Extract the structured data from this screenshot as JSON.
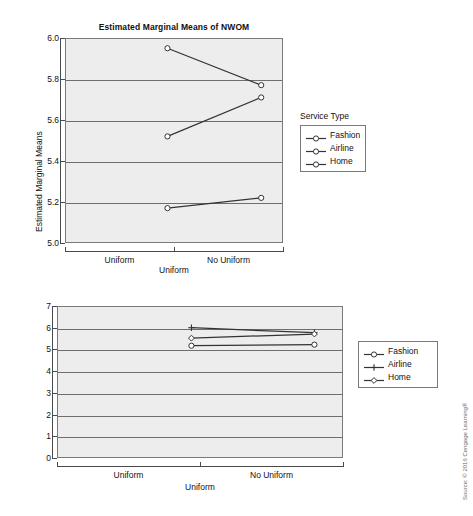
{
  "source_note": "Source: © 2016 Cengage Learning®",
  "charts": [
    {
      "id": "top",
      "title": "Estimated Marginal Means of NWOM",
      "ylabel": "Estimated Marginal Means",
      "xlabel": "Uniform",
      "categories": [
        "Uniform",
        "No Uniform"
      ],
      "yticks": [
        "6.0",
        "5.8",
        "5.6",
        "5.4",
        "5.2",
        "5.0"
      ],
      "legend_title": "Service Type",
      "legend": [
        {
          "label": "Fashion",
          "marker": "circle"
        },
        {
          "label": "Airline",
          "marker": "circle"
        },
        {
          "label": "Home",
          "marker": "circle"
        }
      ]
    },
    {
      "id": "bottom",
      "title": "",
      "ylabel": "NWOM LS Means",
      "xlabel": "Uniform",
      "categories": [
        "Uniform",
        "No Uniform"
      ],
      "yticks": [
        "7",
        "6",
        "5",
        "4",
        "3",
        "2",
        "1",
        "0"
      ],
      "legend_title": "",
      "legend": [
        {
          "label": "Fashion",
          "marker": "circle"
        },
        {
          "label": "Airline",
          "marker": "plus"
        },
        {
          "label": "Home",
          "marker": "diamond"
        }
      ]
    }
  ],
  "chart_data": [
    {
      "type": "line",
      "title": "Estimated Marginal Means of NWOM",
      "xlabel": "Uniform",
      "ylabel": "Estimated Marginal Means",
      "categories": [
        "Uniform",
        "No Uniform"
      ],
      "ylim": [
        5.0,
        6.0
      ],
      "ytick_step": 0.2,
      "grid": true,
      "legend_title": "Service Type",
      "legend_position": "right",
      "series": [
        {
          "name": "Fashion",
          "marker": "circle",
          "values": [
            5.95,
            5.77
          ]
        },
        {
          "name": "Airline",
          "marker": "circle",
          "values": [
            5.52,
            5.71
          ]
        },
        {
          "name": "Home",
          "marker": "circle",
          "values": [
            5.17,
            5.22
          ]
        }
      ]
    },
    {
      "type": "line",
      "title": "",
      "xlabel": "Uniform",
      "ylabel": "NWOM LS Means",
      "categories": [
        "Uniform",
        "No Uniform"
      ],
      "ylim": [
        0,
        7
      ],
      "ytick_step": 1,
      "grid": true,
      "legend_title": "",
      "legend_position": "right",
      "series": [
        {
          "name": "Fashion",
          "marker": "circle",
          "values": [
            5.17,
            5.22
          ]
        },
        {
          "name": "Airline",
          "marker": "plus",
          "values": [
            6.0,
            5.77
          ]
        },
        {
          "name": "Home",
          "marker": "diamond",
          "values": [
            5.52,
            5.71
          ]
        }
      ]
    }
  ]
}
